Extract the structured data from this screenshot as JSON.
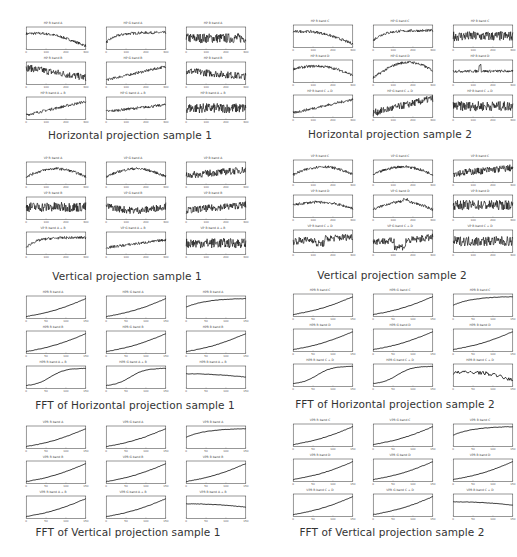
{
  "panels": [
    {
      "id": "hp1",
      "caption": "Horizontal projection sample 1",
      "x": 18,
      "y": 27,
      "cap_x": 0,
      "cap_y": 129,
      "kind": "noisy",
      "titles": [
        "HP R band A",
        "HP G band A",
        "HP B band A",
        "HP R band B",
        "HP G band B",
        "HP B band B",
        "HP R band A + B",
        "HP G band A + B",
        "HP B band A + B"
      ],
      "xticks": [
        "0",
        "100",
        "200",
        "300"
      ]
    },
    {
      "id": "hp2",
      "caption": "Horizontal projection sample 2",
      "x": 285,
      "y": 25,
      "cap_x": 260,
      "cap_y": 128,
      "kind": "noisy",
      "titles": [
        "HP R band C",
        "HP G band C",
        "HP B band C",
        "HP R band D",
        "HP G band D",
        "HP B band D",
        "HP R band C + D",
        "HP G band C + D",
        "HP B band C + D"
      ],
      "xticks": [
        "0",
        "100",
        "200",
        "300"
      ]
    },
    {
      "id": "vp1",
      "caption": "Vertical projection sample 1",
      "x": 18,
      "y": 162,
      "cap_x": -3,
      "cap_y": 270,
      "kind": "noisy",
      "titles": [
        "VP R band A",
        "VP G band A",
        "VP B band A",
        "VP R band B",
        "VP G band B",
        "VP B band B",
        "VP R band A + B",
        "VP G band A + B",
        "VP B band A + B"
      ],
      "xticks": [
        "0",
        "100",
        "200",
        "300"
      ]
    },
    {
      "id": "vp2",
      "caption": "Vertical projection sample 2",
      "x": 285,
      "y": 160,
      "cap_x": 262,
      "cap_y": 269,
      "kind": "noisy",
      "titles": [
        "VP R band C",
        "VP G band C",
        "VP B band C",
        "VP R band D",
        "VP G band D",
        "VP B band D",
        "VP R band C + D",
        "VP G band C + D",
        "VP B band C + D"
      ],
      "xticks": [
        "0",
        "100",
        "200",
        "300"
      ]
    },
    {
      "id": "fhp1",
      "caption": "FFT of Horizontal projection sample 1",
      "x": 18,
      "y": 296,
      "cap_x": 5,
      "cap_y": 399,
      "kind": "smooth",
      "titles": [
        "HPR R band A",
        "HPR G band A",
        "HPR B band A",
        "HPR R band B",
        "HPR G band B",
        "HPR B band B",
        "HPR R band A + B",
        "HPR G band A + B",
        "HPR B band A + B"
      ],
      "xticks": [
        "0",
        "50",
        "100",
        "150"
      ]
    },
    {
      "id": "fhp2",
      "caption": "FFT of Horizontal projection sample 2",
      "x": 285,
      "y": 294,
      "cap_x": 265,
      "cap_y": 398,
      "kind": "smooth",
      "titles": [
        "HPR R band C",
        "HPR G band C",
        "HPR B band C",
        "HPR R band D",
        "HPR G band D",
        "HPR B band D",
        "HPR R band C + D",
        "HPR G band C + D",
        "HPR B band C + D"
      ],
      "xticks": [
        "0",
        "50",
        "100",
        "150"
      ]
    },
    {
      "id": "fvp1",
      "caption": "FFT of Vertical projection sample 1",
      "x": 18,
      "y": 426,
      "cap_x": -2,
      "cap_y": 526,
      "kind": "smooth",
      "titles": [
        "VPR R band A",
        "VPR G band A",
        "VPR B band A",
        "VPR R band B",
        "VPR G band B",
        "VPR B band B",
        "VPR R band A + B",
        "VPR G band A + B",
        "VPR B band A + B"
      ],
      "xticks": [
        "0",
        "50",
        "100",
        "150"
      ]
    },
    {
      "id": "fvp2",
      "caption": "FFT of Vertical projection sample 2",
      "x": 285,
      "y": 424,
      "cap_x": 262,
      "cap_y": 526,
      "kind": "smooth",
      "titles": [
        "VPR R band C",
        "VPR G band C",
        "VPR B band C",
        "VPR R band D",
        "VPR G band D",
        "VPR B band D",
        "VPR R band C + D",
        "VPR G band C + D",
        "VPR B band C + D"
      ],
      "xticks": [
        "0",
        "50",
        "100",
        "150"
      ]
    }
  ],
  "chart_data": [
    {
      "type": "line",
      "title": "Horizontal projection sample 1",
      "layout": "3x3 small multiples",
      "xlim": [
        0,
        300
      ],
      "series_shapes": [
        "hump then decline",
        "rise then plateau",
        "flat noisy",
        "noisy decline",
        "rising",
        "noisy slight decline",
        "rising",
        "slight rise",
        "flat noisy"
      ]
    },
    {
      "type": "line",
      "title": "Horizontal projection sample 2",
      "layout": "3x3 small multiples",
      "xlim": [
        0,
        300
      ],
      "series_shapes": [
        "hump then decline",
        "rise then plateau",
        "flat noisy",
        "arch then decline",
        "rise then fall",
        "flat with spike",
        "rising",
        "rising noisy",
        "flat noisy"
      ]
    },
    {
      "type": "line",
      "title": "Vertical projection sample 1",
      "layout": "3x3 small multiples",
      "xlim": [
        0,
        300
      ],
      "series_shapes": [
        "arch",
        "arch",
        "slight rise noisy",
        "noisy flat",
        "noisy dip",
        "slight rise noisy",
        "rise then plateau",
        "slow rise",
        "flat noisy"
      ]
    },
    {
      "type": "line",
      "title": "Vertical projection sample 2",
      "layout": "3x3 small multiples",
      "xlim": [
        0,
        300
      ],
      "series_shapes": [
        "arch",
        "arch",
        "slight rise noisy",
        "gentle arch",
        "arch with peak",
        "noisy flat",
        "noisy with dip",
        "noisy dip then rise",
        "flat noisy"
      ]
    },
    {
      "type": "line",
      "title": "FFT of Horizontal projection sample 1",
      "layout": "3x3 small multiples",
      "xlim": [
        0,
        150
      ],
      "series_shapes": [
        "increasing",
        "increasing",
        "saturating",
        "increasing",
        "increasing",
        "increasing",
        "sigmoid",
        "sigmoid",
        "flat slight decline"
      ]
    },
    {
      "type": "line",
      "title": "FFT of Horizontal projection sample 2",
      "layout": "3x3 small multiples",
      "xlim": [
        0,
        150
      ],
      "series_shapes": [
        "increasing",
        "increasing",
        "saturating",
        "increasing",
        "increasing",
        "increasing",
        "sigmoid",
        "sigmoid",
        "noisy hump decline"
      ]
    },
    {
      "type": "line",
      "title": "FFT of Vertical projection sample 1",
      "layout": "3x3 small multiples",
      "xlim": [
        0,
        150
      ],
      "series_shapes": [
        "increasing",
        "increasing",
        "saturating",
        "increasing",
        "increasing",
        "increasing",
        "increasing",
        "increasing",
        "flat slight decline"
      ]
    },
    {
      "type": "line",
      "title": "FFT of Vertical projection sample 2",
      "layout": "3x3 small multiples",
      "xlim": [
        0,
        150
      ],
      "series_shapes": [
        "increasing",
        "increasing",
        "saturating",
        "increasing",
        "increasing",
        "increasing",
        "increasing",
        "increasing",
        "flat slight decline"
      ]
    }
  ]
}
